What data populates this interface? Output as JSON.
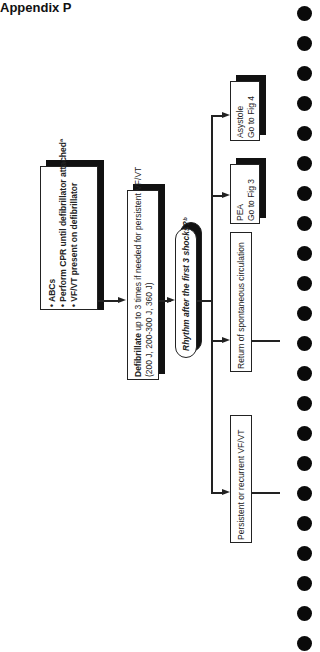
{
  "header": {
    "title": "Appendix P"
  },
  "diagram": {
    "orientation": "rotated-90-ccw",
    "boxes": {
      "start": {
        "lines": [
          "• ABCs",
          "• Perform CPR until defibrillator attachedª",
          "• VF/VT present on defibrillator"
        ]
      },
      "defib": {
        "bold_word": "Defibrillate",
        "line1_rest": " up to 3 times if needed for persistent VF/VT",
        "line2": "(200 J, 200-300 J, 360 J)"
      },
      "decision": {
        "label": "Rhythm after the first 3 shocks?ᵇ"
      },
      "outcomes": [
        {
          "id": "persistent",
          "line1": "Persistent or recurrent VF/VT",
          "line2": ""
        },
        {
          "id": "rosc",
          "line1": "Return of spontaneous circulation",
          "line2": ""
        },
        {
          "id": "pea",
          "line1": "PEA",
          "line2": "Go to Fig 3"
        },
        {
          "id": "asystole",
          "line1": "Asystole",
          "line2": "Go to Fig 4"
        }
      ]
    }
  },
  "binder_holes": {
    "count": 22
  }
}
